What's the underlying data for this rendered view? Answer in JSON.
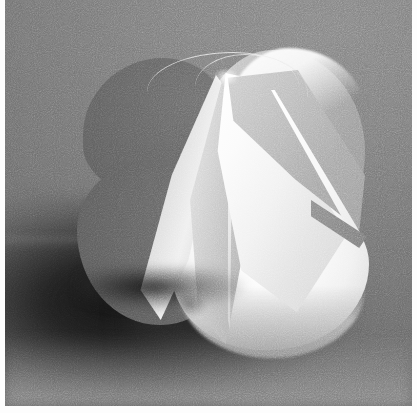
{
  "image": {
    "title": "Folded paper sphere sculpture",
    "medium": "black-and-white photograph",
    "subject": "paper petal sphere",
    "lighting": "key light from upper right",
    "background_tone": "#8f8f8f",
    "highlight_tone": "#ffffff",
    "shadow_tone": "#141414",
    "midtone": "#a8a8a8",
    "dark_lobe_tone": "#646464",
    "frame": {
      "margin_color": "#fdfdfd",
      "left_margin_px": 5,
      "right_margin_px": 5,
      "bottom_margin_px": 7
    },
    "elements": {
      "backdrop": "seamless gray studio sweep",
      "cast_shadow": "dark blurred shadow falling to lower left",
      "back_lobe_upper": "dark petal lobe silhouette, upper left",
      "back_lobe_lower": "dark petal lobe silhouette, lower left",
      "right_lobe": "mid-gray petal back, right side",
      "bottom_lobe": "bright white petal, lower right",
      "petal_far_left": "narrow lit petal at far left of fan",
      "petal_left_center": "large petal with bright crease",
      "petal_center": "broad white front petal",
      "petal_right_inner": "gray back-face petal with white fold edge",
      "filament": "thin lit paper rim arcing up-left from apex",
      "apex_top": "convergence point of petals at top",
      "apex_bottom": "convergence point of petals at bottom",
      "contact_shadow": "dark contact shadow under sphere",
      "grain": "photographic film grain"
    }
  }
}
